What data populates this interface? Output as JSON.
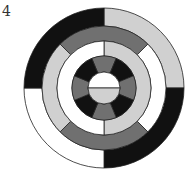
{
  "figure": {
    "label": "4",
    "center": [
      104,
      88
    ],
    "stroke": "#222222",
    "colors": {
      "black": "#111111",
      "darkgray": "#707070",
      "lightgray": "#d0d0d0",
      "white": "#ffffff"
    },
    "rings": [
      {
        "name": "outer-ring",
        "r_outer": 80,
        "r_inner": 62,
        "segments": [
          {
            "start": 0,
            "end": 90,
            "fill": "lightgray"
          },
          {
            "start": 90,
            "end": 180,
            "fill": "black"
          },
          {
            "start": 180,
            "end": 270,
            "fill": "white"
          },
          {
            "start": 270,
            "end": 360,
            "fill": "black"
          }
        ]
      },
      {
        "name": "second-ring",
        "r_outer": 62,
        "r_inner": 47,
        "segments": [
          {
            "start": -45,
            "end": 45,
            "fill": "darkgray"
          },
          {
            "start": 45,
            "end": 135,
            "fill": "white"
          },
          {
            "start": 135,
            "end": 225,
            "fill": "darkgray"
          },
          {
            "start": 225,
            "end": 315,
            "fill": "lightgray"
          }
        ]
      },
      {
        "name": "third-ring",
        "r_outer": 47,
        "r_inner": 32,
        "segments": [
          {
            "start": 0,
            "end": 180,
            "fill": "lightgray"
          },
          {
            "start": 180,
            "end": 360,
            "fill": "white"
          }
        ]
      },
      {
        "name": "fourth-ring",
        "r_outer": 32,
        "r_inner": 16,
        "segments": [
          {
            "start": -22.5,
            "end": 22.5,
            "fill": "darkgray"
          },
          {
            "start": 22.5,
            "end": 67.5,
            "fill": "black"
          },
          {
            "start": 67.5,
            "end": 112.5,
            "fill": "darkgray"
          },
          {
            "start": 112.5,
            "end": 157.5,
            "fill": "black"
          },
          {
            "start": 157.5,
            "end": 202.5,
            "fill": "darkgray"
          },
          {
            "start": 202.5,
            "end": 247.5,
            "fill": "black"
          },
          {
            "start": 247.5,
            "end": 292.5,
            "fill": "darkgray"
          },
          {
            "start": 292.5,
            "end": 337.5,
            "fill": "black"
          }
        ]
      },
      {
        "name": "center-disc",
        "r_outer": 16,
        "r_inner": 0,
        "segments": [
          {
            "start": -90,
            "end": 90,
            "fill": "white"
          },
          {
            "start": 90,
            "end": 270,
            "fill": "lightgray"
          }
        ]
      }
    ]
  }
}
